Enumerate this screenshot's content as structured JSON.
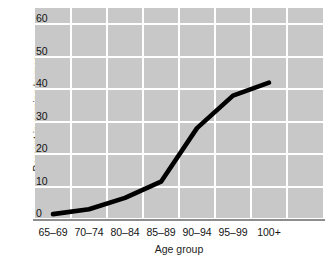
{
  "chart_data": {
    "type": "line",
    "title": "",
    "subtitle": "",
    "xlabel": "Age group",
    "ylabel": "Percent in nursing homes",
    "categories": [
      "65–69",
      "70–74",
      "80–84",
      "85–89",
      "90–94",
      "95–99",
      "100+"
    ],
    "values": [
      1.5,
      3,
      6.5,
      11.5,
      28,
      38,
      42
    ],
    "series": [
      {
        "name": "Percent in nursing homes",
        "values": [
          1.5,
          3,
          6.5,
          11.5,
          28,
          38,
          42
        ]
      }
    ],
    "ylim": [
      0,
      65
    ],
    "yticks": [
      0,
      10,
      20,
      30,
      40,
      50,
      60
    ],
    "ytick_labels": [
      "0",
      "10",
      "20",
      "30",
      "40",
      "50",
      "60"
    ],
    "grid": true,
    "grid_color": "#ffffff",
    "plot_background": "#c8c8c8",
    "line_color": "#000000",
    "legend": "none",
    "legend_position": "none"
  },
  "axes": {
    "y_title": "Percent in nursing homes",
    "x_title": "Age group"
  }
}
